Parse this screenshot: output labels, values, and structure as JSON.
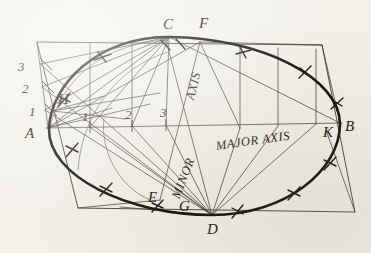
{
  "figure": {
    "kind": "engineering-drawing",
    "background_color": "#f2f0e9",
    "ink_color": "#16140f"
  },
  "text_labels": {
    "major_axis": "MAJOR AXIS",
    "minor": "MINOR",
    "axis": "AXIS"
  },
  "points": [
    {
      "id": "A",
      "label": "A",
      "x": 33,
      "y": 136
    },
    {
      "id": "B",
      "label": "B",
      "x": 345,
      "y": 131
    },
    {
      "id": "C",
      "label": "C",
      "x": 166,
      "y": 33
    },
    {
      "id": "D",
      "label": "D",
      "x": 210,
      "y": 237
    },
    {
      "id": "E",
      "label": "E",
      "x": 150,
      "y": 203
    },
    {
      "id": "F",
      "label": "F",
      "x": 201,
      "y": 31
    },
    {
      "id": "G",
      "label": "G",
      "x": 181,
      "y": 213
    },
    {
      "id": "H",
      "label": "H",
      "x": 62,
      "y": 105
    },
    {
      "id": "K",
      "label": "K",
      "x": 326,
      "y": 138
    }
  ],
  "divisions_left_edge": [
    {
      "label": "3",
      "x": 22,
      "y": 71
    },
    {
      "label": "2",
      "x": 26,
      "y": 93
    },
    {
      "label": "1",
      "x": 33,
      "y": 116
    }
  ],
  "divisions_major_axis": [
    {
      "label": "1",
      "x": 85,
      "y": 124
    },
    {
      "label": "2",
      "x": 128,
      "y": 122
    },
    {
      "label": "3",
      "x": 163,
      "y": 120
    }
  ],
  "rotations": {
    "major_axis_deg": -8,
    "minor_deg": -69,
    "axis_deg": -76
  },
  "geometry": {
    "parallelogram": [
      [
        37,
        42
      ],
      [
        322,
        45
      ],
      [
        355,
        212
      ],
      [
        78,
        208
      ]
    ],
    "major_axis_line": [
      [
        48,
        128
      ],
      [
        340,
        123
      ]
    ],
    "minor_axis_line": [
      [
        166,
        40
      ],
      [
        212,
        215
      ]
    ]
  }
}
